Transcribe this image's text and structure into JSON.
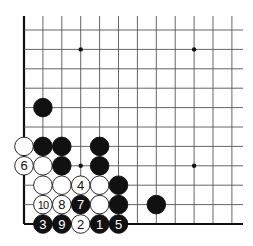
{
  "diagram": {
    "board": {
      "columns": 12,
      "rows": 11,
      "edges": [
        "left",
        "bottom"
      ],
      "star_points": [
        {
          "col": 3,
          "row": 9
        },
        {
          "col": 9,
          "row": 9
        },
        {
          "col": 3,
          "row": 3
        },
        {
          "col": 9,
          "row": 3
        }
      ]
    },
    "stones": [
      {
        "color": "black",
        "col": 1,
        "row": 6,
        "label": ""
      },
      {
        "color": "white",
        "col": 0,
        "row": 4,
        "label": ""
      },
      {
        "color": "black",
        "col": 1,
        "row": 4,
        "label": ""
      },
      {
        "color": "black",
        "col": 2,
        "row": 4,
        "label": ""
      },
      {
        "color": "black",
        "col": 4,
        "row": 4,
        "label": ""
      },
      {
        "color": "white",
        "col": 0,
        "row": 3,
        "label": "6"
      },
      {
        "color": "white",
        "col": 1,
        "row": 3,
        "label": ""
      },
      {
        "color": "black",
        "col": 2,
        "row": 3,
        "label": ""
      },
      {
        "color": "black",
        "col": 4,
        "row": 3,
        "label": ""
      },
      {
        "color": "white",
        "col": 1,
        "row": 2,
        "label": ""
      },
      {
        "color": "white",
        "col": 2,
        "row": 2,
        "label": ""
      },
      {
        "color": "white",
        "col": 3,
        "row": 2,
        "label": "4"
      },
      {
        "color": "white",
        "col": 4,
        "row": 2,
        "label": ""
      },
      {
        "color": "black",
        "col": 5,
        "row": 2,
        "label": ""
      },
      {
        "color": "white",
        "col": 1,
        "row": 1,
        "label": "10"
      },
      {
        "color": "white",
        "col": 2,
        "row": 1,
        "label": "8"
      },
      {
        "color": "black",
        "col": 3,
        "row": 1,
        "label": "7"
      },
      {
        "color": "white",
        "col": 4,
        "row": 1,
        "label": ""
      },
      {
        "color": "black",
        "col": 5,
        "row": 1,
        "label": ""
      },
      {
        "color": "black",
        "col": 7,
        "row": 1,
        "label": ""
      },
      {
        "color": "black",
        "col": 1,
        "row": 0,
        "label": "3"
      },
      {
        "color": "black",
        "col": 2,
        "row": 0,
        "label": "9"
      },
      {
        "color": "white",
        "col": 3,
        "row": 0,
        "label": "2"
      },
      {
        "color": "black",
        "col": 4,
        "row": 0,
        "label": "1"
      },
      {
        "color": "black",
        "col": 5,
        "row": 0,
        "label": "5"
      }
    ],
    "colors": {
      "line": "#555555",
      "edge": "#111111",
      "black_stone": "#111111",
      "white_stone": "#ffffff",
      "background": "#ffffff"
    }
  }
}
